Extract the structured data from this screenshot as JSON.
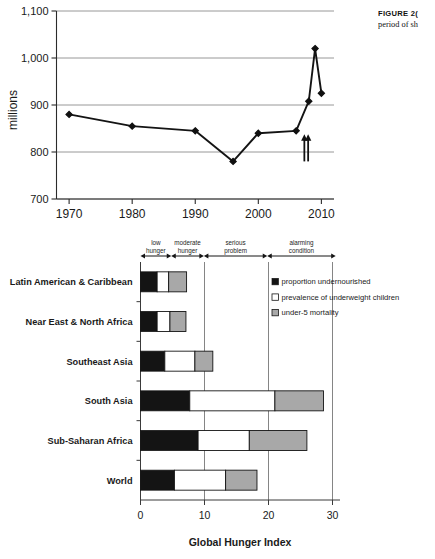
{
  "caption": {
    "label": "FIGURE",
    "number": "2(",
    "line2": "period of sh"
  },
  "chart_data": [
    {
      "type": "line",
      "title": "",
      "xlabel": "",
      "ylabel": "millions",
      "x": [
        1970,
        1980,
        1990,
        1996,
        2000,
        2006,
        2008,
        2009,
        2010
      ],
      "values": [
        880,
        855,
        845,
        780,
        840,
        845,
        908,
        1020,
        925
      ],
      "xlim": [
        1968,
        2012
      ],
      "ylim": [
        700,
        1100
      ],
      "xticks": [
        "1970",
        "1980",
        "1990",
        "2000",
        "2010"
      ],
      "xtick_values": [
        1970,
        1980,
        1990,
        2000,
        2010
      ],
      "yticks": [
        "700",
        "800",
        "900",
        "1,000",
        "1,100"
      ],
      "ytick_values": [
        700,
        800,
        900,
        1000,
        1100
      ],
      "grid": "horizontal",
      "legend": "none",
      "annotations": [
        {
          "name": "up-arrow-a",
          "x": 2007.3,
          "y_from": 780,
          "y_to": 838
        },
        {
          "name": "up-arrow-b",
          "x": 2007.9,
          "y_from": 780,
          "y_to": 838
        }
      ]
    },
    {
      "type": "bar",
      "orientation": "horizontal",
      "stacked": true,
      "title": "",
      "xlabel": "Global Hunger Index",
      "ylabel": "",
      "categories": [
        "Latin American & Caribbean",
        "Near East & North Africa",
        "Southeast Asia",
        "South Asia",
        "Sub-Saharan Africa",
        "World"
      ],
      "series": [
        {
          "name": "proportion undernourished",
          "color": "#141414",
          "values": [
            2.6,
            2.6,
            3.8,
            7.7,
            9.0,
            5.3
          ]
        },
        {
          "name": "prevalence of underweight children",
          "color": "#ffffff",
          "values": [
            1.8,
            2.0,
            4.7,
            13.3,
            8.0,
            8.0
          ]
        },
        {
          "name": "under-5 mortality",
          "color": "#a8a8a8",
          "values": [
            2.8,
            2.5,
            2.8,
            7.6,
            9.0,
            4.9
          ]
        }
      ],
      "totals": [
        7.2,
        7.1,
        11.3,
        28.6,
        26.0,
        18.2
      ],
      "xlim": [
        0,
        31
      ],
      "xticks": [
        "0",
        "10",
        "20",
        "30"
      ],
      "xtick_values": [
        0,
        10,
        20,
        30
      ],
      "grid": "vertical",
      "legend_position": "upper-right",
      "severity_scale": [
        {
          "label_line1": "low",
          "label_line2": "hunger",
          "from": 0.0,
          "to": 4.8
        },
        {
          "label_line1": "moderate",
          "label_line2": "hunger",
          "from": 4.8,
          "to": 9.9
        },
        {
          "label_line1": "serious",
          "label_line2": "problem",
          "from": 9.9,
          "to": 19.8
        },
        {
          "label_line1": "alarming",
          "label_line2": "condition",
          "from": 19.8,
          "to": 30.5
        }
      ]
    }
  ]
}
